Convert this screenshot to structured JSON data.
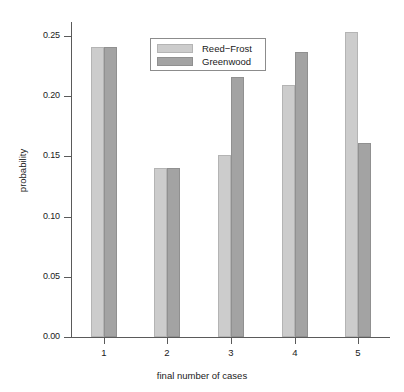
{
  "chart_data": {
    "type": "bar",
    "title": "",
    "subtitle": "",
    "xlabel": "final number of cases",
    "ylabel": "probability",
    "categories": [
      "1",
      "2",
      "3",
      "4",
      "5"
    ],
    "series": [
      {
        "name": "Reed−Frost",
        "color": "#cccccc",
        "values": [
          0.241,
          0.14,
          0.151,
          0.209,
          0.253
        ]
      },
      {
        "name": "Greenwood",
        "color": "#a3a3a3",
        "values": [
          0.241,
          0.14,
          0.216,
          0.237,
          0.161
        ]
      }
    ],
    "ylim": [
      0.0,
      0.25
    ],
    "ytick_labels": [
      "0.00",
      "0.05",
      "0.10",
      "0.15",
      "0.20",
      "0.25"
    ],
    "ytick_values": [
      0.0,
      0.05,
      0.1,
      0.15,
      0.2,
      0.25
    ],
    "xtick_labels": [
      "1",
      "2",
      "3",
      "4",
      "5"
    ],
    "grid": false,
    "legend_position": "top-center",
    "legend_entries": [
      "Reed−Frost",
      "Greenwood"
    ],
    "axis_color": "#5a5a5a",
    "background": "#ffffff"
  }
}
